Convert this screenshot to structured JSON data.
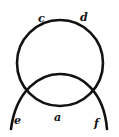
{
  "diagram": {
    "stroke_color": "#111111",
    "background_color": "#ffffff",
    "labels": {
      "c": "c",
      "d": "d",
      "e": "e",
      "a": "a",
      "f": "f"
    }
  }
}
